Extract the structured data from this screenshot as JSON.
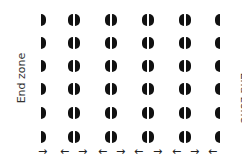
{
  "labels": {
    "left": "End zone",
    "right": "End zone"
  },
  "rows_y": [
    20,
    43,
    66,
    89,
    113,
    137
  ],
  "columns": [
    {
      "name": "column-1",
      "halves": [
        "right"
      ],
      "x": 41
    },
    {
      "name": "column-2",
      "halves": [
        "left",
        "right"
      ],
      "x": 74
    },
    {
      "name": "column-3",
      "halves": [
        "left",
        "right"
      ],
      "x": 111
    },
    {
      "name": "column-4",
      "halves": [
        "left",
        "right"
      ],
      "x": 148
    },
    {
      "name": "column-5",
      "halves": [
        "left",
        "right"
      ],
      "x": 185
    },
    {
      "name": "column-6",
      "halves": [
        "left"
      ],
      "x": 220
    }
  ],
  "arrows": [
    {
      "dir": "right",
      "glyph": "→",
      "x": 38
    },
    {
      "dir": "left",
      "glyph": "←",
      "x": 60
    },
    {
      "dir": "right",
      "glyph": "→",
      "x": 78
    },
    {
      "dir": "left",
      "glyph": "←",
      "x": 98
    },
    {
      "dir": "right",
      "glyph": "→",
      "x": 116
    },
    {
      "dir": "left",
      "glyph": "←",
      "x": 134
    },
    {
      "dir": "right",
      "glyph": "→",
      "x": 153
    },
    {
      "dir": "left",
      "glyph": "←",
      "x": 172
    },
    {
      "dir": "right",
      "glyph": "→",
      "x": 190
    },
    {
      "dir": "left",
      "glyph": "←",
      "x": 208
    }
  ],
  "arrow_y": 146
}
